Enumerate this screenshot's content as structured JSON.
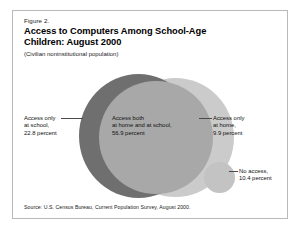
{
  "figure": {
    "number": "Figure 2.",
    "title_line1": "Access to Computers Among School-Age",
    "title_line2": "Children:  August 2000",
    "subtitle": "(Civilian noninstitutional population)",
    "source": "Source: U.S. Census Bureau, Current Population Survey, August  2000."
  },
  "labels": {
    "school_only": {
      "line1": "Access only",
      "line2": "at school,",
      "line3": "22.8 percent"
    },
    "both": {
      "line1": "Access both",
      "line2": "at home and at school,",
      "line3": "56.9 percent"
    },
    "home_only": {
      "line1": "Access only",
      "line2": "at home,",
      "line3": "9.9 percent"
    },
    "no_access": {
      "line1": "No access,",
      "line2": "10.4 percent"
    }
  },
  "colors": {
    "school_only": "#6f6f6f",
    "both": "#a8a8a8",
    "home_only": "#cbcbcb",
    "no_access": "#c3c3c3",
    "frame_border": "#b9b9b9",
    "text": "#111111"
  },
  "chart_data": {
    "type": "pie",
    "title": "Access to Computers Among School-Age Children:  August 2000",
    "subtitle": "(Civilian noninstitutional population)",
    "xlabel": "",
    "ylabel": "",
    "units": "percent",
    "legend_position": "none",
    "grid": false,
    "categories": [
      "Access only at school",
      "Access both at home and at school",
      "Access only at home",
      "No access"
    ],
    "values": [
      22.8,
      56.9,
      9.9,
      10.4
    ],
    "colors": [
      "#6f6f6f",
      "#a8a8a8",
      "#cbcbcb",
      "#c3c3c3"
    ],
    "annotations": [
      "Access only at school, 22.8 percent",
      "Access both at home and at school, 56.9 percent",
      "Access only at home, 9.9 percent",
      "No access, 10.4 percent"
    ],
    "source": "Source: U.S. Census Bureau, Current Population Survey, August  2000."
  }
}
